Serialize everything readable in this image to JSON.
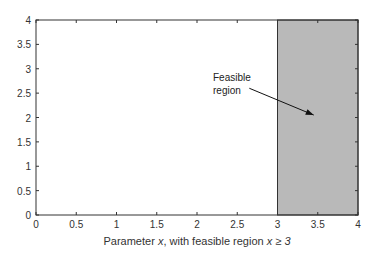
{
  "chart_data": {
    "type": "area",
    "title": "",
    "xlabel": "Parameter x, with feasible region x ≥ 3",
    "xlabel_parts": {
      "prefix": "Parameter ",
      "var": "x",
      "middle": ", with feasible region ",
      "cond": "x ≥ 3"
    },
    "ylabel": "",
    "xlim": [
      0,
      4
    ],
    "ylim": [
      0,
      4
    ],
    "xticks": [
      "0",
      "0.5",
      "1",
      "1.5",
      "2",
      "2.5",
      "3",
      "3.5",
      "4"
    ],
    "yticks": [
      "0",
      "0.5",
      "1",
      "1.5",
      "2",
      "2.5",
      "3",
      "3.5",
      "4"
    ],
    "grid": false,
    "shaded_region": {
      "x_min": 3,
      "x_max": 4,
      "y_min": 0,
      "y_max": 4,
      "color": "#b9b9b9"
    },
    "annotation": {
      "text_line1": "Feasible",
      "text_line2": "region",
      "arrow_from": [
        2.65,
        2.6
      ],
      "arrow_to": [
        3.45,
        2.05
      ]
    }
  }
}
